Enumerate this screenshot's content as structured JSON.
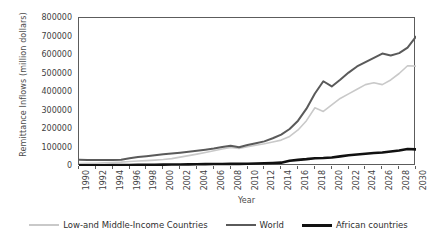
{
  "chart_data": {
    "type": "line",
    "title": "",
    "xlabel": "Year",
    "ylabel": "Remittance Inflows (million dollars)",
    "xlim": [
      1990,
      2030
    ],
    "ylim": [
      0,
      800000
    ],
    "ytick_step": 100000,
    "xtick_step": 2,
    "grid": false,
    "legend_position": "bottom",
    "x": [
      1990,
      1991,
      1992,
      1993,
      1994,
      1995,
      1996,
      1997,
      1998,
      1999,
      2000,
      2001,
      2002,
      2003,
      2004,
      2005,
      2006,
      2007,
      2008,
      2009,
      2010,
      2011,
      2012,
      2013,
      2014,
      2015,
      2016,
      2017,
      2018,
      2019,
      2020,
      2021,
      2022,
      2023,
      2024,
      2025,
      2026,
      2027,
      2028,
      2029,
      2030
    ],
    "ytick_labels": [
      "0",
      "100000",
      "200000",
      "300000",
      "400000",
      "500000",
      "600000",
      "700000",
      "800000"
    ],
    "ytick_values": [
      0,
      100000,
      200000,
      300000,
      400000,
      500000,
      600000,
      700000,
      800000
    ],
    "xtick_labels": [
      "1990",
      "1992",
      "1994",
      "1996",
      "1998",
      "2000",
      "2002",
      "2004",
      "2006",
      "2008",
      "2010",
      "2012",
      "2014",
      "2016",
      "2018",
      "2020",
      "2022",
      "2024",
      "2026",
      "2028",
      "2030"
    ],
    "xtick_values": [
      1990,
      1992,
      1994,
      1996,
      1998,
      2000,
      2002,
      2004,
      2006,
      2008,
      2010,
      2012,
      2014,
      2016,
      2018,
      2020,
      2022,
      2024,
      2026,
      2028,
      2030
    ],
    "series": [
      {
        "name": "Low-and Middle-Income Countries",
        "color": "#c9c9c9",
        "width": 1.6,
        "values": [
          13000,
          14000,
          15000,
          17000,
          19000,
          21000,
          24000,
          27000,
          29000,
          32000,
          35000,
          40000,
          48000,
          56000,
          64000,
          73000,
          82000,
          92000,
          100000,
          95000,
          104000,
          112000,
          120000,
          130000,
          140000,
          160000,
          195000,
          245000,
          315000,
          295000,
          330000,
          365000,
          390000,
          415000,
          440000,
          450000,
          440000,
          465000,
          500000,
          542000,
          540000
        ]
      },
      {
        "name": "World",
        "color": "#5a5a5a",
        "width": 2.0,
        "values": [
          34000,
          33000,
          33000,
          33000,
          33000,
          34000,
          42000,
          49000,
          53000,
          58000,
          63000,
          67000,
          72000,
          77000,
          82000,
          88000,
          95000,
          103000,
          110000,
          101000,
          113000,
          123000,
          133000,
          150000,
          170000,
          200000,
          245000,
          310000,
          392000,
          458000,
          430000,
          466000,
          505000,
          538000,
          562000,
          585000,
          608000,
          597000,
          610000,
          640000,
          700000
        ]
      },
      {
        "name": "African countries",
        "color": "#111111",
        "width": 2.6,
        "values": [
          4000,
          4000,
          4000,
          4000,
          4500,
          5000,
          5500,
          6000,
          6500,
          7000,
          7500,
          8000,
          8500,
          9000,
          9500,
          10000,
          10500,
          11000,
          12000,
          11500,
          12500,
          13500,
          14500,
          16000,
          18000,
          28000,
          33000,
          37000,
          42000,
          43000,
          46000,
          52000,
          58000,
          62000,
          66000,
          70000,
          73000,
          78000,
          84000,
          92000,
          90000
        ]
      }
    ]
  },
  "legend": [
    {
      "label": "Low-and Middle-Income Countries",
      "color": "#c9c9c9",
      "width": 2
    },
    {
      "label": "World",
      "color": "#5a5a5a",
      "width": 2
    },
    {
      "label": "African countries",
      "color": "#111111",
      "width": 3
    }
  ]
}
